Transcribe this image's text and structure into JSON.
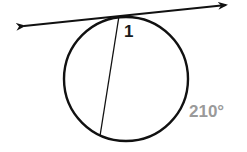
{
  "diagram": {
    "type": "circle-tangent-chord",
    "labels": {
      "angle": "1",
      "arc_measure": "210°"
    },
    "colors": {
      "stroke": "#111111",
      "angle_label": "#1a1a1a",
      "arc_label": "#9a9a9a"
    }
  }
}
